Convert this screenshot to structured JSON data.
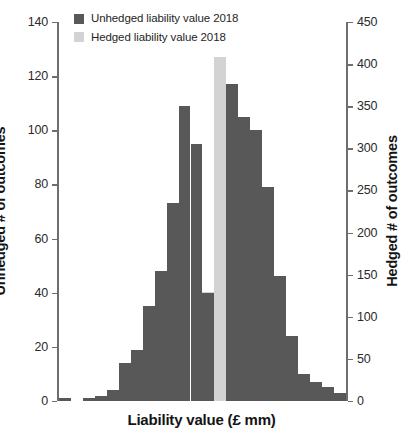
{
  "chart_data": {
    "type": "bar",
    "title": "",
    "subtitle": "",
    "xlabel": "Liability value (£ mm)",
    "ylabel": "Unhedged # of outcomes",
    "y2label": "Hedged # of outcomes",
    "grid": false,
    "legend_position": "top-left",
    "ylim": [
      0,
      140
    ],
    "y2lim": [
      0,
      450
    ],
    "yticks": [
      0,
      20,
      40,
      60,
      80,
      100,
      120,
      140
    ],
    "ytick_labels": [
      "0",
      "20",
      "40",
      "60",
      "80",
      "100",
      "120",
      "140"
    ],
    "y2ticks": [
      0,
      50,
      100,
      150,
      200,
      250,
      300,
      350,
      400,
      450
    ],
    "y2tick_labels": [
      "0",
      "50",
      "100",
      "150",
      "200",
      "250",
      "300",
      "350",
      "400",
      "450"
    ],
    "xticks": [],
    "xtick_labels": [],
    "n_bins": 20,
    "colors": {
      "unhedged": "#585858",
      "hedged": "#d3d3d3",
      "axis": "#6e6e6e",
      "text": "#222222",
      "background": "#ffffff"
    },
    "series": [
      {
        "name": "Unhedged liability value 2018",
        "axis": "left",
        "color": "#585858",
        "values": [
          1,
          0,
          1,
          2,
          4,
          14,
          19,
          35,
          48,
          73,
          109,
          95,
          116,
          117,
          105,
          100,
          79,
          46,
          24,
          10,
          7,
          5,
          3
        ]
      },
      {
        "name": "Hedged liability value 2018",
        "axis": "right",
        "color": "#d3d3d3",
        "values": [
          0,
          0,
          0,
          0,
          0,
          0,
          0,
          0,
          0,
          0,
          0,
          21,
          130,
          409,
          369,
          67,
          0,
          0,
          0,
          0,
          0,
          0,
          0
        ]
      }
    ],
    "bars": [
      {
        "index": 0,
        "unhedged": 1,
        "hedged": 0
      },
      {
        "index": 1,
        "unhedged": 0,
        "hedged": 0
      },
      {
        "index": 2,
        "unhedged": 1,
        "hedged": 0
      },
      {
        "index": 3,
        "unhedged": 2,
        "hedged": 0
      },
      {
        "index": 4,
        "unhedged": 4,
        "hedged": 0
      },
      {
        "index": 5,
        "unhedged": 14,
        "hedged": 0
      },
      {
        "index": 6,
        "unhedged": 19,
        "hedged": 0
      },
      {
        "index": 7,
        "unhedged": 35,
        "hedged": 0
      },
      {
        "index": 8,
        "unhedged": 48,
        "hedged": 0
      },
      {
        "index": 9,
        "unhedged": 73,
        "hedged": 0
      },
      {
        "index": 10,
        "unhedged": 109,
        "hedged": 0
      },
      {
        "index": 11,
        "unhedged": 95,
        "hedged": 21
      },
      {
        "index": 12,
        "unhedged": 40,
        "hedged": 130
      },
      {
        "index": 13,
        "unhedged": 0,
        "hedged": 409
      },
      {
        "index": 14,
        "unhedged": 117,
        "hedged": 369
      },
      {
        "index": 15,
        "unhedged": 105,
        "hedged": 67
      },
      {
        "index": 16,
        "unhedged": 100,
        "hedged": 0
      },
      {
        "index": 17,
        "unhedged": 79,
        "hedged": 0
      },
      {
        "index": 18,
        "unhedged": 46,
        "hedged": 0
      },
      {
        "index": 19,
        "unhedged": 24,
        "hedged": 0
      },
      {
        "index": 20,
        "unhedged": 10,
        "hedged": 0
      },
      {
        "index": 21,
        "unhedged": 7,
        "hedged": 0
      },
      {
        "index": 22,
        "unhedged": 5,
        "hedged": 0
      },
      {
        "index": 23,
        "unhedged": 3,
        "hedged": 0
      }
    ]
  },
  "legend": {
    "items": [
      {
        "label": "Unhedged liability value 2018",
        "color": "#585858",
        "swatch_name": "legend-swatch-unhedged"
      },
      {
        "label": "Hedged liability value 2018",
        "color": "#d3d3d3",
        "swatch_name": "legend-swatch-hedged"
      }
    ]
  },
  "axes": {
    "left_title": "Unhedged # of outcomes",
    "right_title": "Hedged # of outcomes",
    "bottom_title": "Liability value (£ mm)"
  }
}
